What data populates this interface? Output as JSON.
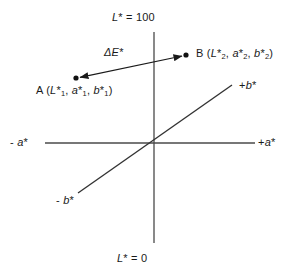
{
  "figure": {
    "axes": {
      "lightness_top": {
        "var": "L",
        "star": "*",
        "rest": " = 100"
      },
      "lightness_bottom": {
        "var": "L",
        "star": "*",
        "rest": " = 0"
      },
      "a_negative": {
        "sign": "- ",
        "var": "a",
        "star": "*"
      },
      "a_positive": {
        "sign": "+",
        "var": "a",
        "star": "*"
      },
      "b_positive": {
        "sign": "+",
        "var": "b",
        "star": "*"
      },
      "b_negative": {
        "sign": "- ",
        "var": "b",
        "star": "*"
      }
    },
    "annotation": {
      "delta_e": {
        "symbol": "ΔE",
        "star": "*"
      }
    },
    "points": [
      {
        "id": "A",
        "name": "A",
        "open_paren": " (",
        "coords": [
          {
            "var": "L",
            "star": "*",
            "sub": "1",
            "sep": ", "
          },
          {
            "var": "a",
            "star": "*",
            "sub": "1",
            "sep": ", "
          },
          {
            "var": "b",
            "star": "*",
            "sub": "1",
            "sep": ""
          }
        ],
        "close_paren": ")",
        "x": 76,
        "y": 78
      },
      {
        "id": "B",
        "name": "B",
        "open_paren": " (",
        "coords": [
          {
            "var": "L",
            "star": "*",
            "sub": "2",
            "sep": ", "
          },
          {
            "var": "a",
            "star": "*",
            "sub": "2",
            "sep": ", "
          },
          {
            "var": "b",
            "star": "*",
            "sub": "2",
            "sep": ""
          }
        ],
        "close_paren": ")",
        "x": 186,
        "y": 55
      }
    ],
    "geometry": {
      "origin_x": 154,
      "origin_y": 143,
      "vertical_axis": {
        "x": 154,
        "y1": 32,
        "y2": 243
      },
      "horizontal_axis": {
        "y": 143,
        "x1": 45,
        "x2": 255
      },
      "diagonal_axis": {
        "x1": 78,
        "y1": 193,
        "x2": 232,
        "y2": 85
      },
      "arrow": {
        "x1": 76,
        "y1": 78,
        "x2": 186,
        "y2": 55
      }
    },
    "colors": {
      "line": "#404040",
      "arrow": "#1a1a1a",
      "dot": "#111111",
      "text": "#1a1a1a",
      "background": "#ffffff"
    }
  }
}
